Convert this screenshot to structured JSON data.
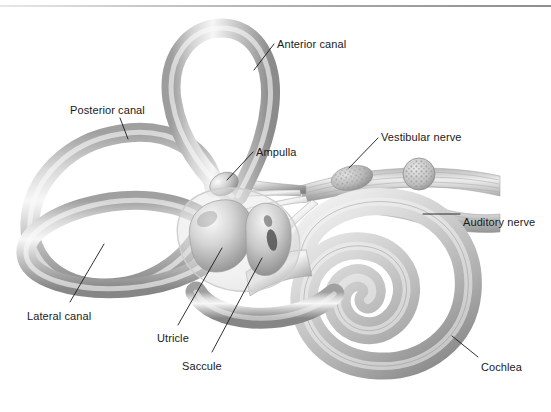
{
  "figure": {
    "background_color": "#ffffff",
    "ink_color": "#1a1a1a",
    "tube_color": "#c2c2c2",
    "tube_highlight": "#f2f2f2",
    "tube_shadow": "#8d8d8d",
    "top_rule_color": "#9a9a9a"
  },
  "labels": [
    {
      "id": "anterior-canal",
      "text": "Anterior canal",
      "x": 277,
      "y": 38,
      "anchor": "start"
    },
    {
      "id": "posterior-canal",
      "text": "Posterior canal",
      "x": 70,
      "y": 104,
      "anchor": "start"
    },
    {
      "id": "ampulla",
      "text": "Ampulla",
      "x": 256,
      "y": 146,
      "anchor": "start"
    },
    {
      "id": "vestibular-nerve",
      "text": "Vestibular nerve",
      "x": 381,
      "y": 131,
      "anchor": "start"
    },
    {
      "id": "auditory-nerve",
      "text": "Auditory nerve",
      "x": 463,
      "y": 216,
      "anchor": "start"
    },
    {
      "id": "cochlea",
      "text": "Cochlea",
      "x": 481,
      "y": 361,
      "anchor": "start"
    },
    {
      "id": "lateral-canal",
      "text": "Lateral canal",
      "x": 27,
      "y": 310,
      "anchor": "start"
    },
    {
      "id": "utricle",
      "text": "Utricle",
      "x": 157,
      "y": 332,
      "anchor": "start"
    },
    {
      "id": "saccule",
      "text": "Saccule",
      "x": 182,
      "y": 360,
      "anchor": "start"
    }
  ],
  "leaders": [
    {
      "id": "leader-anterior-canal",
      "x1": 274,
      "y1": 44,
      "x2": 254,
      "y2": 70
    },
    {
      "id": "leader-posterior-canal",
      "x1": 120,
      "y1": 118,
      "x2": 128,
      "y2": 139
    },
    {
      "id": "leader-ampulla",
      "x1": 253,
      "y1": 152,
      "x2": 227,
      "y2": 180
    },
    {
      "id": "leader-vestibular-nerve",
      "x1": 378,
      "y1": 138,
      "x2": 349,
      "y2": 168
    },
    {
      "id": "leader-auditory-nerve",
      "x1": 460,
      "y1": 214,
      "x2": 423,
      "y2": 214
    },
    {
      "id": "leader-cochlea",
      "x1": 478,
      "y1": 357,
      "x2": 452,
      "y2": 336
    },
    {
      "id": "leader-lateral-canal",
      "x1": 70,
      "y1": 302,
      "x2": 104,
      "y2": 244
    },
    {
      "id": "leader-utricle",
      "x1": 178,
      "y1": 325,
      "x2": 222,
      "y2": 248
    },
    {
      "id": "leader-saccule",
      "x1": 212,
      "y1": 352,
      "x2": 262,
      "y2": 258
    }
  ],
  "structures": [
    {
      "id": "anterior-canal-loop",
      "name": "Anterior semicircular canal"
    },
    {
      "id": "posterior-canal-loop",
      "name": "Posterior semicircular canal"
    },
    {
      "id": "lateral-canal-loop",
      "name": "Lateral semicircular canal"
    },
    {
      "id": "vestibule",
      "name": "Vestibule membrane"
    },
    {
      "id": "utricle-sac",
      "name": "Utricle"
    },
    {
      "id": "saccule-sac",
      "name": "Saccule"
    },
    {
      "id": "ampulla-swelling",
      "name": "Ampulla"
    },
    {
      "id": "vestibular-nerve-bundle",
      "name": "Vestibular nerve"
    },
    {
      "id": "auditory-nerve-bundle",
      "name": "Auditory nerve"
    },
    {
      "id": "cochlea-spiral",
      "name": "Cochlea"
    }
  ]
}
